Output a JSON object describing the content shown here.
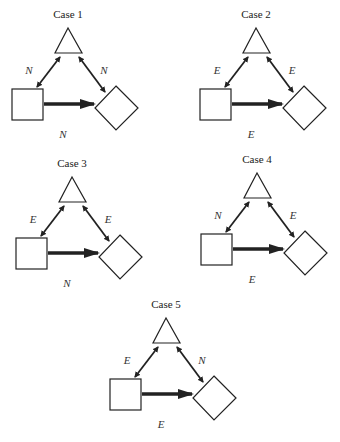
{
  "diagram": {
    "node_shapes": {
      "top": "triangle",
      "left": "square",
      "right": "diamond"
    },
    "edges": {
      "left_edge": "square <-> triangle (double-headed thin arrow)",
      "right_edge": "triangle <-> diamond (double-headed thin arrow)",
      "bottom_edge": "square -> diamond (thick arrow)"
    },
    "cases": [
      {
        "title": "Case 1",
        "left_label": "N",
        "right_label": "N",
        "bottom_label": "N"
      },
      {
        "title": "Case 2",
        "left_label": "E",
        "right_label": "E",
        "bottom_label": "E"
      },
      {
        "title": "Case 3",
        "left_label": "E",
        "right_label": "E",
        "bottom_label": "N"
      },
      {
        "title": "Case 4",
        "left_label": "N",
        "right_label": "E",
        "bottom_label": "E"
      },
      {
        "title": "Case 5",
        "left_label": "E",
        "right_label": "N",
        "bottom_label": "E"
      }
    ]
  },
  "colors": {
    "stroke": "#222222",
    "background": "#ffffff"
  }
}
